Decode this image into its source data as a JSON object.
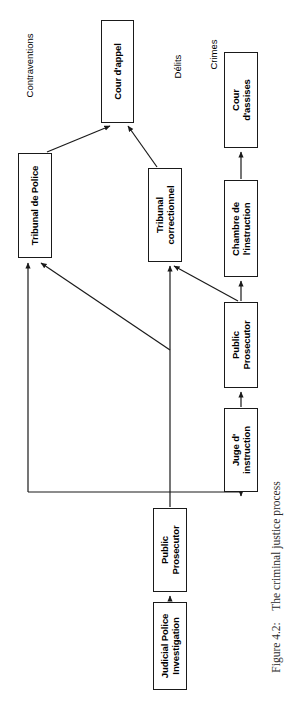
{
  "figure": {
    "caption": "Figure 4.2:  The criminal justice process",
    "caption_number": "Figure 4.2:",
    "caption_text": "The criminal justice process",
    "orientation": "rotated-90-ccw",
    "background": "#ffffff",
    "line_color": "#1a1a1a"
  },
  "categories": [
    {
      "label": "Contraventions"
    },
    {
      "label": "Délits"
    },
    {
      "label": "Crimes"
    }
  ],
  "nodes": [
    {
      "id": "cour-appel",
      "label": "Cour d'appel",
      "lines": [
        "Cour d'appel"
      ]
    },
    {
      "id": "cour-assises",
      "label": "Cour d'assises",
      "lines": [
        "Cour",
        "d'assises"
      ]
    },
    {
      "id": "tribunal-police",
      "label": "Tribunal de Police",
      "lines": [
        "Tribunal de Police"
      ]
    },
    {
      "id": "tribunal-correctionnel",
      "label": "Tribunal correctionnel",
      "lines": [
        "Tribunal",
        "correctionnel"
      ]
    },
    {
      "id": "chambre-instruction",
      "label": "Chambre de l'instruction",
      "lines": [
        "Chambre de",
        "l'instruction"
      ]
    },
    {
      "id": "public-prosecutor-top",
      "label": "Public Prosecutor",
      "lines": [
        "Public",
        "Prosecutor"
      ]
    },
    {
      "id": "juge-instruction",
      "label": "Juge d' instruction",
      "lines": [
        "Juge d'",
        "instruction"
      ]
    },
    {
      "id": "public-prosecutor-bottom",
      "label": "Public Prosecutor",
      "lines": [
        "Public",
        "Prosecutor"
      ]
    },
    {
      "id": "judicial-police",
      "label": "Judicial Police Investigation",
      "lines": [
        "Judicial Police",
        "Investigation"
      ]
    }
  ],
  "edges": [
    {
      "from": "tribunal-police",
      "to": "cour-appel"
    },
    {
      "from": "tribunal-correctionnel",
      "to": "cour-appel"
    },
    {
      "from": "chambre-instruction",
      "to": "cour-assises"
    },
    {
      "from": "public-prosecutor-top",
      "to": "chambre-instruction"
    },
    {
      "from": "public-prosecutor-top",
      "to": "tribunal-correctionnel"
    },
    {
      "from": "public-prosecutor-bottom",
      "to": "tribunal-police"
    },
    {
      "from": "public-prosecutor-bottom",
      "to": "tribunal-correctionnel"
    },
    {
      "from": "public-prosecutor-bottom",
      "to": "juge-instruction"
    },
    {
      "from": "juge-instruction",
      "to": "public-prosecutor-top"
    },
    {
      "from": "judicial-police",
      "to": "public-prosecutor-bottom"
    }
  ]
}
